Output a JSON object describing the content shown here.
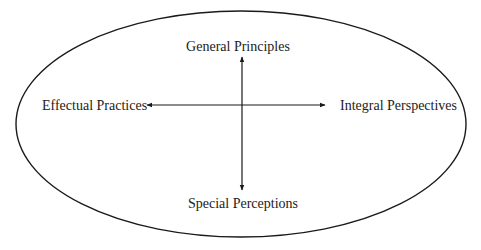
{
  "diagram": {
    "type": "quadrant-axes-in-ellipse",
    "colors": {
      "stroke": "#1a1a1a",
      "text": "#222222",
      "background": "#ffffff"
    },
    "ellipse": {
      "cx": 241,
      "cy": 124,
      "rx": 225,
      "ry": 113
    },
    "axes": {
      "vertical": {
        "x": 242,
        "y1": 57,
        "y2": 190,
        "arrows": "both"
      },
      "horizontal": {
        "y": 105,
        "x1": 147,
        "x2": 325,
        "arrows": "both"
      }
    },
    "labels": {
      "top": "General Principles",
      "bottom": "Special Perceptions",
      "left": "Effectual Practices",
      "right": "Integral Perspectives"
    }
  }
}
